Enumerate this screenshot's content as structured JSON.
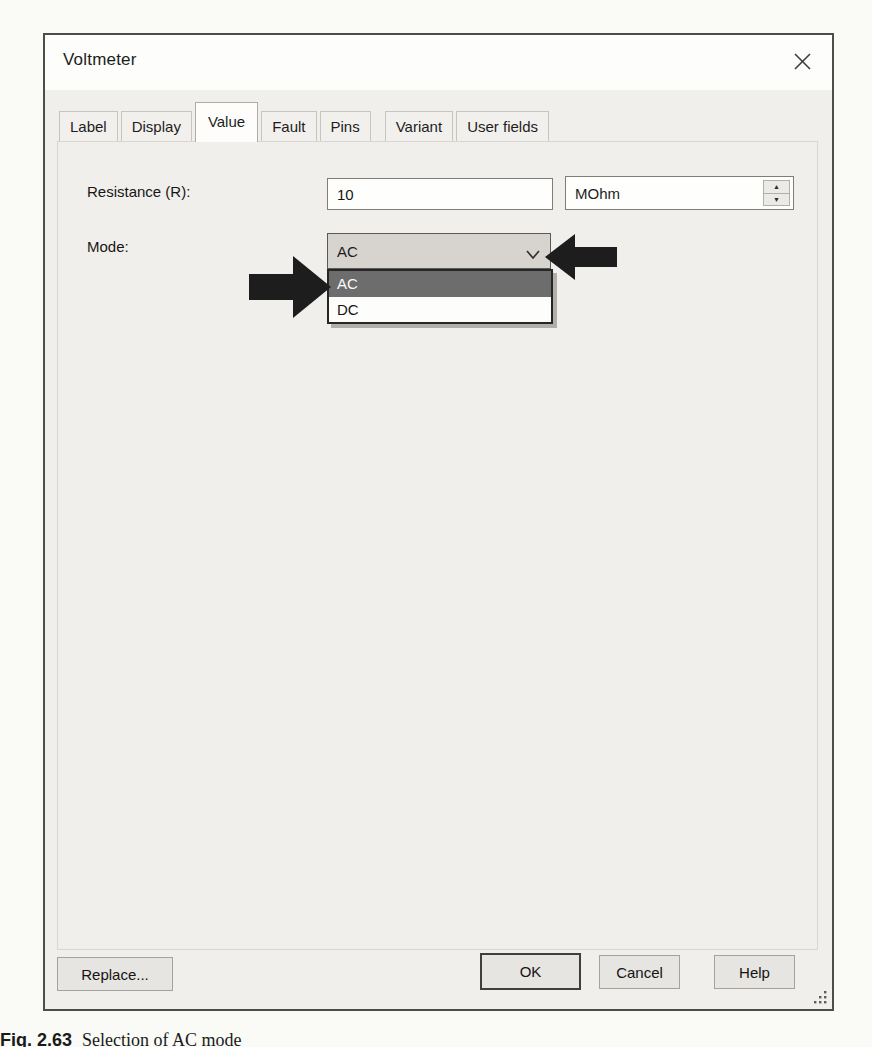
{
  "dialog": {
    "title": "Voltmeter",
    "active_tab": "Value",
    "tabs": [
      {
        "label": "Label"
      },
      {
        "label": "Display"
      },
      {
        "label": "Value"
      },
      {
        "label": "Fault"
      },
      {
        "label": "Pins"
      },
      {
        "label": "Variant"
      },
      {
        "label": "User fields"
      }
    ],
    "fields": {
      "resistance": {
        "label": "Resistance (R):",
        "value": "10",
        "unit": "MOhm"
      },
      "mode": {
        "label": "Mode:",
        "selected": "AC",
        "options": [
          "AC",
          "DC"
        ],
        "highlighted_option": "AC"
      }
    },
    "buttons": {
      "replace": "Replace...",
      "ok": "OK",
      "cancel": "Cancel",
      "help": "Help"
    },
    "icons": {
      "close": "close-x",
      "chevron": "chevron-down",
      "spinner_up": "▲",
      "spinner_down": "▼"
    }
  },
  "annotations": {
    "left_arrow": "points-right-at-highlighted-AC-option",
    "right_arrow": "points-left-at-combobox-chevron"
  },
  "caption": {
    "fig_label": "Fig. 2.63",
    "text": "Selection of AC mode"
  },
  "colors": {
    "dialog_bg": "#f1efec",
    "titlebar_bg": "#fdfdfb",
    "combo_bg": "#d7d4d0",
    "highlight_bg": "#6d6d6d",
    "highlight_text": "#fbfbfa",
    "annotation_arrow": "#1d1d1d",
    "page_bg": "#fafaf6"
  }
}
